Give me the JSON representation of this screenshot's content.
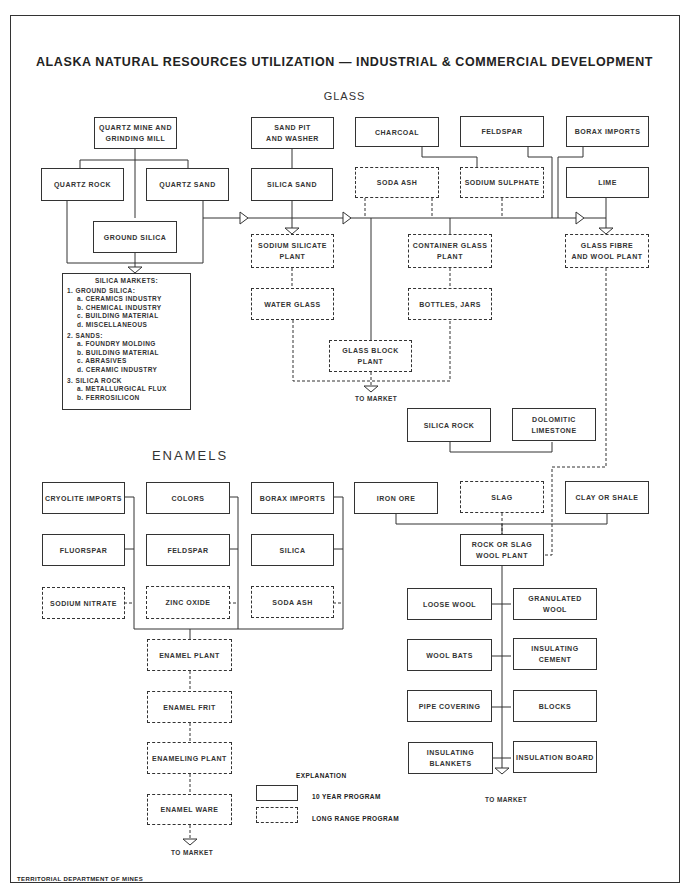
{
  "title": "ALASKA NATURAL RESOURCES UTILIZATION — INDUSTRIAL & COMMERCIAL DEVELOPMENT",
  "sections": {
    "glass": "GLASS",
    "enamels": "ENAMELS"
  },
  "glass": {
    "quartz_mine": "QUARTZ MINE AND\nGRINDING MILL",
    "quartz_rock": "QUARTZ ROCK",
    "quartz_sand": "QUARTZ SAND",
    "ground_silica": "GROUND SILICA",
    "sand_pit": "SAND PIT\nAND WASHER",
    "silica_sand": "SILICA SAND",
    "charcoal": "CHARCOAL",
    "feldspar": "FELDSPAR",
    "borax_imports": "BORAX IMPORTS",
    "soda_ash": "SODA ASH",
    "sodium_sulphate": "SODIUM SULPHATE",
    "lime": "LIME",
    "sodium_silicate_plant": "SODIUM SILICATE\nPLANT",
    "container_glass_plant": "CONTAINER GLASS\nPLANT",
    "glass_fibre_plant": "GLASS FIBRE\nAND WOOL PLANT",
    "water_glass": "WATER GLASS",
    "bottles_jars": "BOTTLES, JARS",
    "glass_block_plant": "GLASS BLOCK\nPLANT",
    "to_market": "TO MARKET"
  },
  "silica_markets": {
    "title": "SILICA MARKETS:",
    "groups": [
      {
        "heading": "1. GROUND SILICA:",
        "items": [
          "a. CERAMICS INDUSTRY",
          "b. CHEMICAL INDUSTRY",
          "c. BUILDING MATERIAL",
          "d. MISCELLANEOUS"
        ]
      },
      {
        "heading": "2. SANDS:",
        "items": [
          "a. FOUNDRY MOLDING",
          "b. BUILDING MATERIAL",
          "c. ABRASIVES",
          "d. CERAMIC INDUSTRY"
        ]
      },
      {
        "heading": "3. SILICA ROCK",
        "items": [
          "a. METALLURGICAL FLUX",
          "b. FERROSILICON"
        ]
      }
    ]
  },
  "wool": {
    "silica_rock": "SILICA ROCK",
    "dolomitic_limestone": "DOLOMITIC\nLIMESTONE",
    "iron_ore": "IRON ORE",
    "slag": "SLAG",
    "clay_or_shale": "CLAY OR SHALE",
    "rock_slag_wool_plant": "ROCK OR SLAG\nWOOL PLANT",
    "products": [
      "LOOSE WOOL",
      "GRANULATED WOOL",
      "WOOL BATS",
      "INSULATING CEMENT",
      "PIPE COVERING",
      "BLOCKS",
      "INSULATING BLANKETS",
      "INSULATION BOARD"
    ],
    "to_market": "TO MARKET"
  },
  "enamels": {
    "cryolite_imports": "CRYOLITE IMPORTS",
    "colors": "COLORS",
    "borax_imports": "BORAX IMPORTS",
    "fluorspar": "FLUORSPAR",
    "feldspar": "FELDSPAR",
    "silica": "SILICA",
    "sodium_nitrate": "SODIUM NITRATE",
    "zinc_oxide": "ZINC OXIDE",
    "soda_ash": "SODA ASH",
    "enamel_plant": "ENAMEL PLANT",
    "enamel_frit": "ENAMEL FRIT",
    "enameling_plant": "ENAMELING PLANT",
    "enamel_ware": "ENAMEL WARE",
    "to_market": "TO MARKET"
  },
  "legend": {
    "title": "EXPLANATION",
    "solid": "10 YEAR PROGRAM",
    "dashed": "LONG RANGE PROGRAM"
  },
  "footer": "TERRITORIAL DEPARTMENT OF MINES"
}
